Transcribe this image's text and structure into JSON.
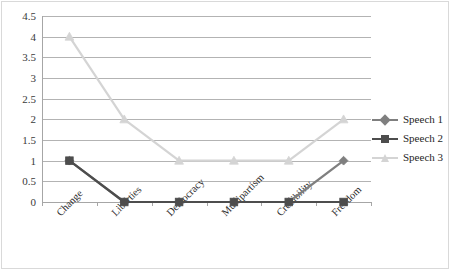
{
  "chart_data": {
    "type": "line",
    "title": "",
    "xlabel": "",
    "ylabel": "",
    "categories": [
      "Change",
      "Liberties",
      "Democracy",
      "Multipartism",
      "Credibility",
      "Freedom"
    ],
    "series": [
      {
        "name": "Speech 1",
        "values": [
          1,
          0,
          0,
          0,
          0,
          1
        ],
        "color": "#7f7f7f",
        "marker": "diamond"
      },
      {
        "name": "Speech 2",
        "values": [
          1,
          0,
          0,
          0,
          0,
          0
        ],
        "color": "#4d4d4d",
        "marker": "square"
      },
      {
        "name": "Speech 3",
        "values": [
          4,
          2,
          1,
          1,
          1,
          2
        ],
        "color": "#d4d4d4",
        "marker": "triangle"
      }
    ],
    "ylim": [
      0,
      4.5
    ],
    "yticks": [
      "0",
      "0.5",
      "1",
      "1.5",
      "2",
      "2.5",
      "3",
      "3.5",
      "4",
      "4.5"
    ],
    "grid": true,
    "legend_position": "right"
  },
  "legend": {
    "items": [
      {
        "label": "Speech 1"
      },
      {
        "label": "Speech 2"
      },
      {
        "label": "Speech 3"
      }
    ]
  }
}
